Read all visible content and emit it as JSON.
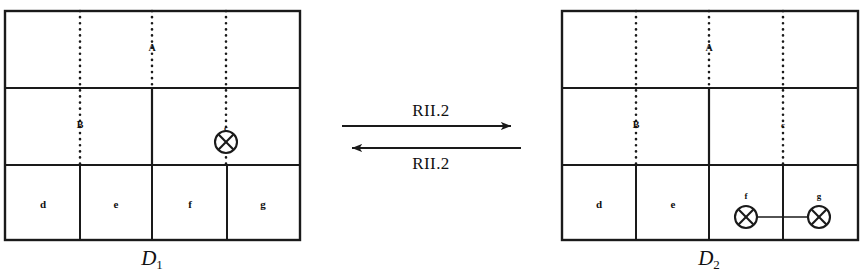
{
  "figure": {
    "kind": "knot-diagram-move",
    "background_color": "#ffffff",
    "ink_color": "#1a1a1a"
  },
  "left_diagram": {
    "name": "D",
    "subscript": "1",
    "frame": {
      "x": 5,
      "y": 11,
      "width": 295,
      "height": 229
    },
    "rows": [
      {
        "name": "top-row",
        "y_top": 11,
        "y_bottom": 88
      },
      {
        "name": "middle-row",
        "y_top": 88,
        "y_bottom": 165
      },
      {
        "name": "bottom-row",
        "y_top": 165,
        "y_bottom": 240
      }
    ],
    "strands": [
      {
        "id": "B",
        "label": "B",
        "x": 80,
        "y_top": 11,
        "y_bottom": 165,
        "label_y": 125
      },
      {
        "id": "A",
        "label": "A",
        "x": 152,
        "y_top": 11,
        "y_bottom": 88,
        "label_y": 48
      },
      {
        "id": "c",
        "label": "c",
        "x": 226,
        "y_top": 11,
        "y_bottom": 165,
        "label_y": 128
      }
    ],
    "dividers": [
      {
        "name": "middle-row-divider",
        "x": 152,
        "y_top": 88,
        "y_bottom": 165
      },
      {
        "name": "bottom-divider-de",
        "x": 80,
        "y_top": 165,
        "y_bottom": 240
      },
      {
        "name": "bottom-divider-ef",
        "x": 152,
        "y_top": 165,
        "y_bottom": 240
      },
      {
        "name": "bottom-divider-fg",
        "x": 227,
        "y_top": 165,
        "y_bottom": 240
      }
    ],
    "cells": [
      {
        "label": "d",
        "x": 43,
        "y": 204
      },
      {
        "label": "e",
        "x": 116,
        "y": 204
      },
      {
        "label": "f",
        "x": 190,
        "y": 204
      },
      {
        "label": "g",
        "x": 263,
        "y": 204
      }
    ],
    "crossings": [
      {
        "id": "c-crossing",
        "x": 226,
        "y": 142,
        "radius": 11
      }
    ],
    "connectors": [],
    "name_position": {
      "x": 152,
      "y": 248
    }
  },
  "right_diagram": {
    "name": "D",
    "subscript": "2",
    "frame": {
      "x": 562,
      "y": 11,
      "width": 296,
      "height": 229
    },
    "rows": [
      {
        "name": "top-row",
        "y_top": 11,
        "y_bottom": 88
      },
      {
        "name": "middle-row",
        "y_top": 88,
        "y_bottom": 165
      },
      {
        "name": "bottom-row",
        "y_top": 165,
        "y_bottom": 240
      }
    ],
    "strands": [
      {
        "id": "B",
        "label": "B",
        "x": 636,
        "y_top": 11,
        "y_bottom": 165,
        "label_y": 125
      },
      {
        "id": "A",
        "label": "A",
        "x": 709,
        "y_top": 11,
        "y_bottom": 88,
        "label_y": 48
      },
      {
        "id": "C",
        "label": "c",
        "x": 783,
        "y_top": 11,
        "y_bottom": 165,
        "label_y": 125
      }
    ],
    "dividers": [
      {
        "name": "middle-row-divider",
        "x": 709,
        "y_top": 88,
        "y_bottom": 165
      },
      {
        "name": "bottom-divider-de",
        "x": 636,
        "y_top": 165,
        "y_bottom": 240
      },
      {
        "name": "bottom-divider-ef",
        "x": 709,
        "y_top": 165,
        "y_bottom": 240
      },
      {
        "name": "bottom-divider-fg",
        "x": 783,
        "y_top": 165,
        "y_bottom": 240
      }
    ],
    "cells": [
      {
        "label": "d",
        "x": 599,
        "y": 204
      },
      {
        "label": "e",
        "x": 673,
        "y": 204
      },
      {
        "label": "f",
        "x": 746,
        "y": 196
      },
      {
        "label": "g",
        "x": 819,
        "y": 196
      }
    ],
    "crossings": [
      {
        "id": "f-crossing",
        "x": 746,
        "y": 217,
        "radius": 11
      },
      {
        "id": "g-crossing",
        "x": 819,
        "y": 217,
        "radius": 11
      }
    ],
    "connectors": [
      {
        "name": "fg-connector",
        "x1": 757,
        "y1": 217,
        "x2": 808,
        "y2": 217
      }
    ],
    "name_position": {
      "x": 709,
      "y": 248
    }
  },
  "move": {
    "forward": {
      "label": "RII.2",
      "label_position": {
        "x": 431,
        "y": 110
      },
      "arrow": {
        "x1": 342,
        "y1": 126,
        "x2": 521,
        "y2": 126,
        "direction": "right"
      }
    },
    "backward": {
      "label": "RII.2",
      "label_position": {
        "x": 431,
        "y": 163
      },
      "arrow": {
        "x1": 521,
        "y1": 148,
        "x2": 342,
        "y2": 148,
        "direction": "left"
      }
    }
  }
}
